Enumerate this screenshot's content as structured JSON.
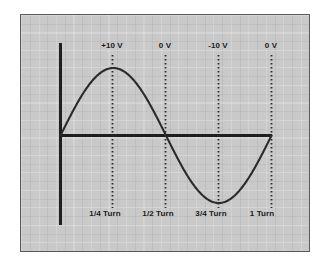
{
  "figure": {
    "background_color": "#ffffff",
    "panel_color": "#c9c9c9",
    "panel_border_color": "#5a5a5a",
    "line_color": "#2b2b2b",
    "axis_color": "#1f1f1f",
    "grid": "on"
  },
  "chart_data": {
    "type": "line",
    "title": "",
    "subtitle": "",
    "xlabel": "",
    "ylabel": "",
    "grid": true,
    "legend": "none",
    "xlim": [
      0,
      1
    ],
    "ylim": [
      -10,
      10
    ],
    "x_unit": "turn",
    "y_unit": "V",
    "series": [
      {
        "name": "Induced voltage",
        "function": "10 * sin(2*pi*x)",
        "x": [
          0,
          0.125,
          0.25,
          0.375,
          0.5,
          0.625,
          0.75,
          0.875,
          1.0
        ],
        "values": [
          0,
          7.07,
          10,
          7.07,
          0,
          -7.07,
          -10,
          -7.07,
          0
        ]
      }
    ],
    "markers": [
      {
        "x": 0.25,
        "voltage": 10,
        "top_label": "+10 V",
        "bottom_label": "1/4 Turn"
      },
      {
        "x": 0.5,
        "voltage": 0,
        "top_label": "0 V",
        "bottom_label": "1/2 Turn"
      },
      {
        "x": 0.75,
        "voltage": -10,
        "top_label": "-10 V",
        "bottom_label": "3/4 Turn"
      },
      {
        "x": 1.0,
        "voltage": 0,
        "top_label": "0 V",
        "bottom_label": "1 Turn"
      }
    ],
    "annotations": {
      "top_labels": [
        "+10 V",
        "0 V",
        "-10 V",
        "0 V"
      ],
      "bottom_labels": [
        "1/4 Turn",
        "1/2 Turn",
        "3/4 Turn",
        "1 Turn"
      ]
    }
  }
}
